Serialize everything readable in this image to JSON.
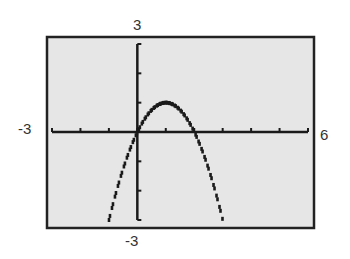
{
  "chart_data": {
    "type": "line",
    "title": "",
    "xlabel": "",
    "ylabel": "",
    "function": "y = -x^2 + 2x",
    "window": {
      "xmin": -3,
      "xmax": 6,
      "xscl": 1,
      "ymin": -3,
      "ymax": 3,
      "yscl": 1
    },
    "xlim": [
      -3,
      6
    ],
    "ylim": [
      -3,
      3
    ],
    "grid": false,
    "legend": null,
    "series": [
      {
        "name": "parabola",
        "style": "dotted pixel line",
        "x": [
          -1.0,
          -0.75,
          -0.5,
          -0.25,
          0.0,
          0.25,
          0.5,
          0.75,
          1.0,
          1.25,
          1.5,
          1.75,
          2.0,
          2.25,
          2.5,
          2.75,
          3.0
        ],
        "y": [
          -3.0,
          -2.06,
          -1.25,
          -0.56,
          0.0,
          0.44,
          0.75,
          0.94,
          1.0,
          0.94,
          0.75,
          0.44,
          0.0,
          -0.56,
          -1.25,
          -2.06,
          -3.0
        ]
      }
    ],
    "vertex": [
      1,
      1
    ],
    "x_intercepts": [
      0,
      2
    ]
  },
  "labels": {
    "ymax": "3",
    "ymin": "-3",
    "xmin": "-3",
    "xmax": "6"
  },
  "colors": {
    "screen_bg": "#e6e6e6",
    "frame": "#222222",
    "axis": "#1a1a1a",
    "curve": "#1a1a1a",
    "label": "#333333"
  }
}
